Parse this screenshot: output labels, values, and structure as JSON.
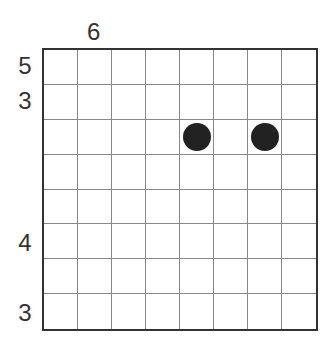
{
  "puzzle": {
    "rows": 8,
    "cols": 8,
    "column_clues": [
      {
        "col": 1,
        "value": "6"
      }
    ],
    "row_clues": [
      {
        "row": 0,
        "value": "5"
      },
      {
        "row": 1,
        "value": "3"
      },
      {
        "row": 5,
        "value": "4"
      },
      {
        "row": 7,
        "value": "3"
      }
    ],
    "filled_cells": [
      {
        "row": 2,
        "col": 4
      },
      {
        "row": 2,
        "col": 6
      }
    ],
    "colors": {
      "grid_border": "#333333",
      "grid_line": "#888888",
      "dot": "#222222",
      "clue_text": "#333333"
    }
  }
}
